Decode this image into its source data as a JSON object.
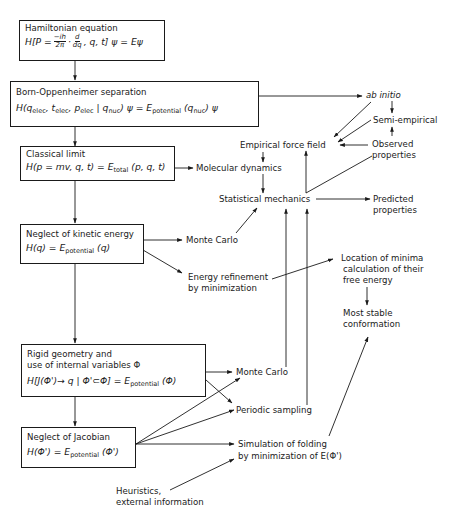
{
  "boxes": {
    "hamiltonian": {
      "title": "Hamiltonian equation",
      "equation": "H[P = −ih/2π · d/dq , q, t] ψ = Eψ"
    },
    "born_oppenheimer": {
      "title": "Born-Oppenheimer separation",
      "equation": "H(q_elec, t_elec, p_elec | q_nuc) ψ = E_potential (q_nuc) ψ"
    },
    "classical": {
      "title": "Classical limit",
      "equation": "H(p = mv, q, t) = E_total (p, q, t)"
    },
    "kinetic": {
      "title": "Neglect of kinetic energy",
      "equation": "H(q) = E_potential (q)"
    },
    "rigid": {
      "title_line1": "Rigid geometry and",
      "title_line2": "use of internal variables Φ",
      "equation": "H[J(Φ')→q | Φ'⊂Φ] = E_potential (Φ)"
    },
    "jacobian": {
      "title": "Neglect of Jacobian",
      "equation": "H(Φ') = E_potential (Φ')"
    }
  },
  "eq_parts": {
    "h1_a": "H[P =",
    "h1_num": "−ih",
    "h1_den": "2π",
    "h1_dot": "·",
    "h1_dnum": "d",
    "h1_dden": "dq",
    "h1_b": ", q, t] ψ = Eψ",
    "bo_a": "H(q",
    "bo_s1": "elec",
    "bo_b": ", t",
    "bo_s2": "elec",
    "bo_c": ", p",
    "bo_s3": "elec",
    "bo_d": " | q",
    "bo_s4": "nuc",
    "bo_e": ")  ψ = E",
    "bo_s5": "potential",
    "bo_f": " (q",
    "bo_s6": "nuc",
    "bo_g": ") ψ",
    "cl_a": "H(p = mv, q, t) = E",
    "cl_s": "total",
    "cl_b": " (p, q, t)",
    "ke_a": "H(q) = E",
    "ke_s": "potential",
    "ke_b": "  (q)",
    "rg_a": "H[J(Φ')→ q | Φ'⊂Φ] = E",
    "rg_s": "potential",
    "rg_b": " (Φ)",
    "jc_a": "H(Φ') = E",
    "jc_s": "potential",
    "jc_b": " (Φ')"
  },
  "labels": {
    "ab_initio": "ab initio",
    "semi_empirical": "Semi-empirical",
    "empirical_force_field": "Empirical force field",
    "observed_properties_1": "Observed",
    "observed_properties_2": "properties",
    "molecular_dynamics": "Molecular dynamics",
    "statistical_mechanics": "Statistical mechanics",
    "predicted_properties_1": "Predicted",
    "predicted_properties_2": "properties",
    "monte_carlo_1": "Monte Carlo",
    "energy_refinement_1": "Energy refinement",
    "energy_refinement_2": "by minimization",
    "location_minima_1": "Location of minima",
    "location_minima_2": "calculation of their",
    "location_minima_3": "free energy",
    "most_stable_1": "Most stable",
    "most_stable_2": "conformation",
    "monte_carlo_2": "Monte Carlo",
    "periodic_sampling": "Periodic sampling",
    "simulation_folding_1": "Simulation of folding",
    "simulation_folding_2": "by minimization of E(Φ')",
    "heuristics_1": "Heuristics,",
    "heuristics_2": "external information"
  },
  "colors": {
    "ink": "#1a1a1a",
    "background": "#ffffff"
  }
}
